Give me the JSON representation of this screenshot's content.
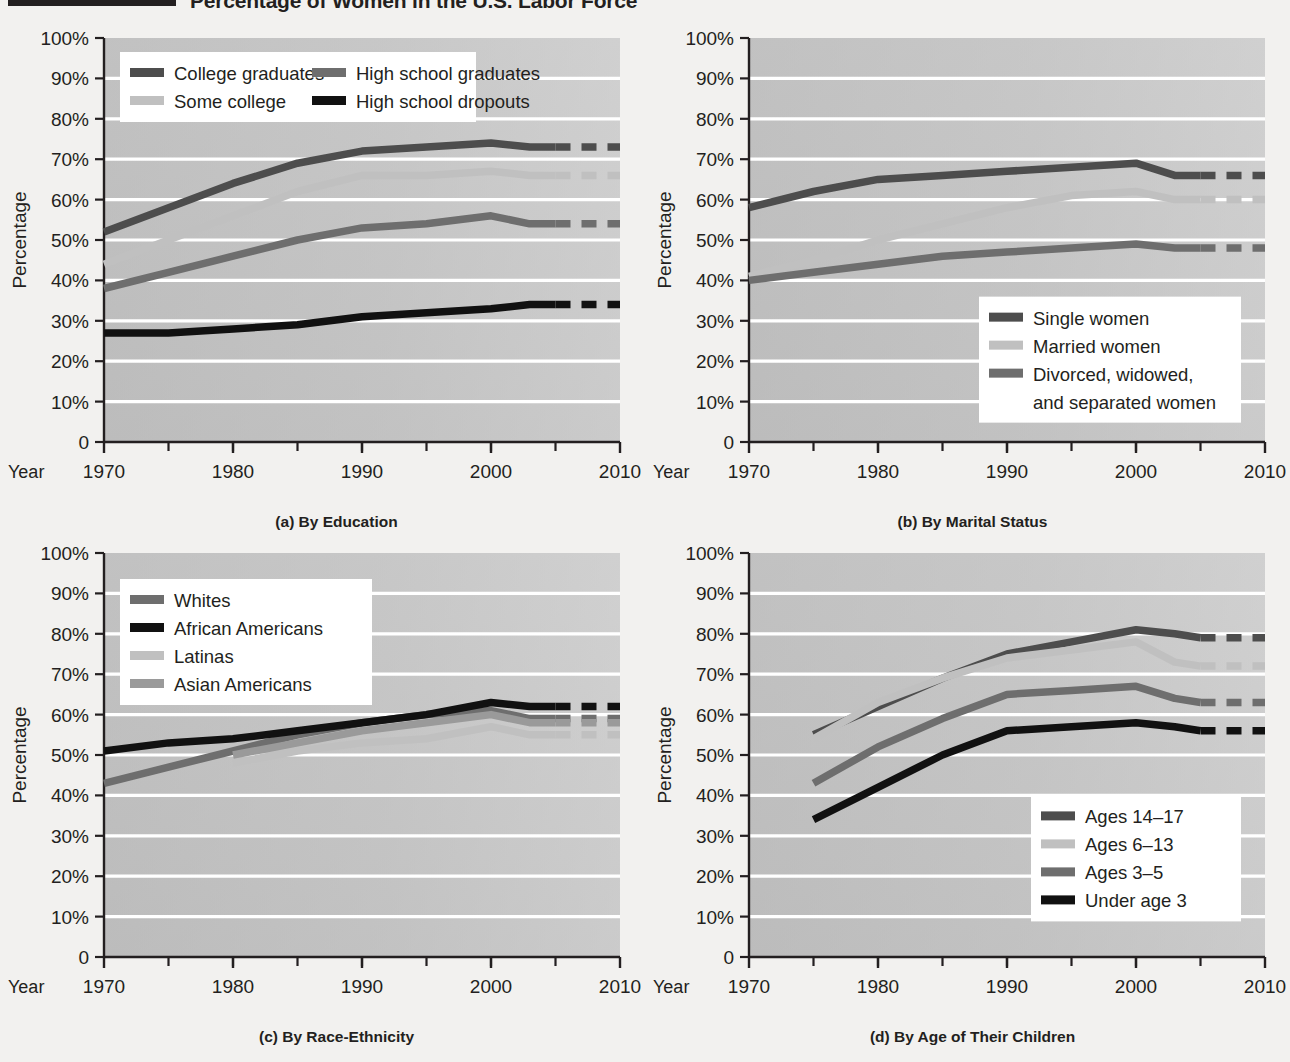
{
  "title": {
    "text": "Percentage of Women in the U.S. Labor Force"
  },
  "axis": {
    "y_label": "Percentage",
    "year_word": "Year",
    "y_ticks": [
      "100%",
      "90%",
      "80%",
      "70%",
      "60%",
      "50%",
      "40%",
      "30%",
      "20%",
      "10%",
      "0"
    ],
    "x_ticks": [
      "1970",
      "1980",
      "1990",
      "2000",
      "2010"
    ]
  },
  "colors": {
    "page_bg": "#f2f1ef",
    "plot_bg_top": "#c9c9c9",
    "plot_bg_bottom": "#bdbdbd",
    "gridline": "#ffffff",
    "axis": "#231f20",
    "dark_gray": "#4d4d4d",
    "mid_gray": "#6e6e6e",
    "light_gray": "#c0c0c0",
    "black": "#111111",
    "legend_bg": "#ffffff"
  },
  "chart_data": [
    {
      "id": "a",
      "type": "line",
      "caption": "(a) By Education",
      "title": "",
      "xlabel": "Year",
      "ylabel": "Percentage",
      "ylim": [
        0,
        100
      ],
      "xlim": [
        1970,
        2010
      ],
      "grid": true,
      "legend_position": "top-left",
      "projection_start": 2005,
      "series": [
        {
          "name": "College graduates",
          "color": "#4d4d4d",
          "x": [
            1970,
            1975,
            1980,
            1985,
            1990,
            1995,
            2000,
            2003,
            2005
          ],
          "values": [
            52,
            58,
            64,
            69,
            72,
            73,
            74,
            73,
            73
          ]
        },
        {
          "name": "Some college",
          "color": "#c0c0c0",
          "x": [
            1970,
            1975,
            1980,
            1985,
            1990,
            1995,
            2000,
            2003,
            2005
          ],
          "values": [
            44,
            50,
            56,
            62,
            66,
            66,
            67,
            66,
            66
          ]
        },
        {
          "name": "High school graduates",
          "color": "#6e6e6e",
          "x": [
            1970,
            1975,
            1980,
            1985,
            1990,
            1995,
            2000,
            2003,
            2005
          ],
          "values": [
            38,
            42,
            46,
            50,
            53,
            54,
            56,
            54,
            54
          ]
        },
        {
          "name": "High school dropouts",
          "color": "#111111",
          "x": [
            1970,
            1975,
            1980,
            1985,
            1990,
            1995,
            2000,
            2003,
            2005
          ],
          "values": [
            27,
            27,
            28,
            29,
            31,
            32,
            33,
            34,
            34
          ]
        }
      ]
    },
    {
      "id": "b",
      "type": "line",
      "caption": "(b) By Marital Status",
      "title": "",
      "xlabel": "Year",
      "ylabel": "Percentage",
      "ylim": [
        0,
        100
      ],
      "xlim": [
        1970,
        2010
      ],
      "grid": true,
      "legend_position": "bottom-right",
      "projection_start": 2005,
      "series": [
        {
          "name": "Single women",
          "color": "#4d4d4d",
          "x": [
            1970,
            1975,
            1980,
            1985,
            1990,
            1995,
            2000,
            2003,
            2005
          ],
          "values": [
            58,
            62,
            65,
            66,
            67,
            68,
            69,
            66,
            66
          ]
        },
        {
          "name": "Married women",
          "color": "#c0c0c0",
          "x": [
            1970,
            1975,
            1980,
            1985,
            1990,
            1995,
            2000,
            2003,
            2005
          ],
          "values": [
            41,
            45,
            50,
            54,
            58,
            61,
            62,
            60,
            60
          ]
        },
        {
          "name": "Divorced, widowed, and separated women",
          "color": "#6e6e6e",
          "x": [
            1970,
            1975,
            1980,
            1985,
            1990,
            1995,
            2000,
            2003,
            2005
          ],
          "values": [
            40,
            42,
            44,
            46,
            47,
            48,
            49,
            48,
            48
          ]
        }
      ]
    },
    {
      "id": "c",
      "type": "line",
      "caption": "(c) By Race-Ethnicity",
      "title": "",
      "xlabel": "Year",
      "ylabel": "Percentage",
      "ylim": [
        0,
        100
      ],
      "xlim": [
        1970,
        2010
      ],
      "grid": true,
      "legend_position": "top-left",
      "projection_start": 2005,
      "series": [
        {
          "name": "Whites",
          "color": "#6e6e6e",
          "x": [
            1970,
            1975,
            1980,
            1985,
            1990,
            1995,
            2000,
            2003,
            2005
          ],
          "values": [
            43,
            47,
            51,
            55,
            58,
            60,
            61,
            59,
            59
          ]
        },
        {
          "name": "African Americans",
          "color": "#111111",
          "x": [
            1970,
            1975,
            1980,
            1985,
            1990,
            1995,
            2000,
            2003,
            2005
          ],
          "values": [
            51,
            53,
            54,
            56,
            58,
            60,
            63,
            62,
            62
          ]
        },
        {
          "name": "Latinas",
          "color": "#c0c0c0",
          "x": [
            1980,
            1985,
            1990,
            1995,
            2000,
            2003,
            2005
          ],
          "values": [
            48,
            51,
            53,
            54,
            57,
            55,
            55
          ]
        },
        {
          "name": "Asian Americans",
          "color": "#9a9a9a",
          "x": [
            1980,
            1985,
            1990,
            1995,
            2000,
            2003,
            2005
          ],
          "values": [
            50,
            53,
            56,
            58,
            60,
            58,
            58
          ]
        }
      ]
    },
    {
      "id": "d",
      "type": "line",
      "caption": "(d) By Age of Their Children",
      "title": "",
      "xlabel": "Year",
      "ylabel": "Percentage",
      "ylim": [
        0,
        100
      ],
      "xlim": [
        1970,
        2010
      ],
      "grid": true,
      "legend_position": "bottom-right",
      "projection_start": 2005,
      "series": [
        {
          "name": "Ages 14–17",
          "color": "#4d4d4d",
          "x": [
            1975,
            1980,
            1985,
            1990,
            1995,
            2000,
            2003,
            2005
          ],
          "values": [
            55,
            62,
            69,
            75,
            78,
            81,
            80,
            79
          ]
        },
        {
          "name": "Ages 6–13",
          "color": "#c0c0c0",
          "x": [
            1975,
            1980,
            1985,
            1990,
            1995,
            2000,
            2003,
            2005
          ],
          "values": [
            54,
            63,
            69,
            74,
            76,
            78,
            73,
            72
          ]
        },
        {
          "name": "Ages 3–5",
          "color": "#6e6e6e",
          "x": [
            1975,
            1980,
            1985,
            1990,
            1995,
            2000,
            2003,
            2005
          ],
          "values": [
            43,
            52,
            59,
            65,
            66,
            67,
            64,
            63
          ]
        },
        {
          "name": "Under age 3",
          "color": "#111111",
          "x": [
            1975,
            1980,
            1985,
            1990,
            1995,
            2000,
            2003,
            2005
          ],
          "values": [
            34,
            42,
            50,
            56,
            57,
            58,
            57,
            56
          ]
        }
      ]
    }
  ]
}
